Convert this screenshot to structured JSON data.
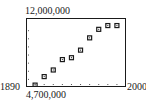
{
  "chart_data": {
    "type": "scatter",
    "title": "",
    "xlabel": "",
    "ylabel": "",
    "xlim": [
      1890,
      2000
    ],
    "ylim": [
      4700000,
      12000000
    ],
    "x_tick_step": 10,
    "grid": false,
    "window_labels": {
      "xmin": "1890",
      "xmax": "2000",
      "ymin": "4,700,000",
      "ymax": "12,000,000"
    },
    "series": [
      {
        "name": "data",
        "x": [
          1900,
          1910,
          1920,
          1930,
          1940,
          1950,
          1960,
          1970,
          1980,
          1990
        ],
        "y": [
          4900000,
          5800000,
          6500000,
          7600000,
          7800000,
          8600000,
          9900000,
          10800000,
          11200000,
          11200000
        ]
      }
    ],
    "marker": "square",
    "colors": {
      "frame": "#1a1a1a",
      "point": "#1a1a1a",
      "tick": "#555555"
    }
  }
}
